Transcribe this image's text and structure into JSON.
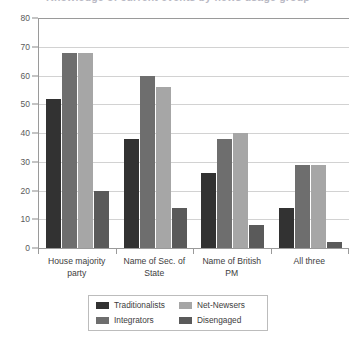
{
  "title_clipped": "Knowledge of current events by news usage group",
  "chart_data": {
    "type": "bar",
    "title": "",
    "xlabel": "",
    "ylabel": "",
    "ylim": [
      0,
      80
    ],
    "ytick_step": 10,
    "yticks": [
      "0",
      "10",
      "20",
      "30",
      "40",
      "50",
      "60",
      "70",
      "80"
    ],
    "grid": true,
    "legend_position": "bottom",
    "categories": [
      "House majority party",
      "Name of Sec. of State",
      "Name of British PM",
      "All three"
    ],
    "category_lines": [
      [
        "House majority",
        "party"
      ],
      [
        "Name of Sec. of",
        "State"
      ],
      [
        "Name of British",
        "PM"
      ],
      [
        "All three"
      ]
    ],
    "series": [
      {
        "name": "Traditionalists",
        "color": "#323232",
        "values": [
          52,
          38,
          26,
          14
        ]
      },
      {
        "name": "Integrators",
        "color": "#6e6e6e",
        "values": [
          68,
          60,
          38,
          29
        ]
      },
      {
        "name": "Net-Newsers",
        "color": "#a6a6a6",
        "values": [
          68,
          56,
          40,
          29
        ]
      },
      {
        "name": "Disengaged",
        "color": "#5a5a5a",
        "values": [
          20,
          14,
          8,
          2
        ]
      }
    ],
    "legend_order": [
      "Traditionalists",
      "Net-Newsers",
      "Integrators",
      "Disengaged"
    ]
  },
  "colors": {
    "traditionalists": "#323232",
    "integrators": "#6e6e6e",
    "net_newsers": "#a6a6a6",
    "disengaged": "#5a5a5a",
    "gridline": "#d2d2d2",
    "axis": "#9a9a9a",
    "text": "#3d3d3d"
  }
}
